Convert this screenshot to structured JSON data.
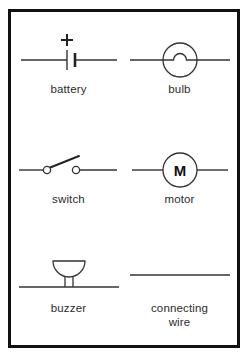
{
  "poster": {
    "title": "Circuit Symbols",
    "background_color": "#ffffff",
    "frame_color": "#111111",
    "stroke_color": "#333333",
    "text_color": "#2b2b2b"
  },
  "symbols": [
    {
      "id": "battery",
      "label": "battery",
      "icon": "battery-symbol",
      "annotation": "+",
      "row": 1,
      "column": 1
    },
    {
      "id": "bulb",
      "label": "bulb",
      "icon": "bulb-symbol",
      "annotation": "",
      "row": 1,
      "column": 2
    },
    {
      "id": "switch",
      "label": "switch",
      "icon": "switch-symbol",
      "annotation": "",
      "row": 2,
      "column": 1
    },
    {
      "id": "motor",
      "label": "motor",
      "icon": "motor-symbol",
      "annotation": "M",
      "row": 2,
      "column": 2
    },
    {
      "id": "buzzer",
      "label": "buzzer",
      "icon": "buzzer-symbol",
      "annotation": "",
      "row": 3,
      "column": 1
    },
    {
      "id": "connecting-wire",
      "label": "connecting\nwire",
      "icon": "wire-symbol",
      "annotation": "",
      "row": 3,
      "column": 2
    }
  ]
}
